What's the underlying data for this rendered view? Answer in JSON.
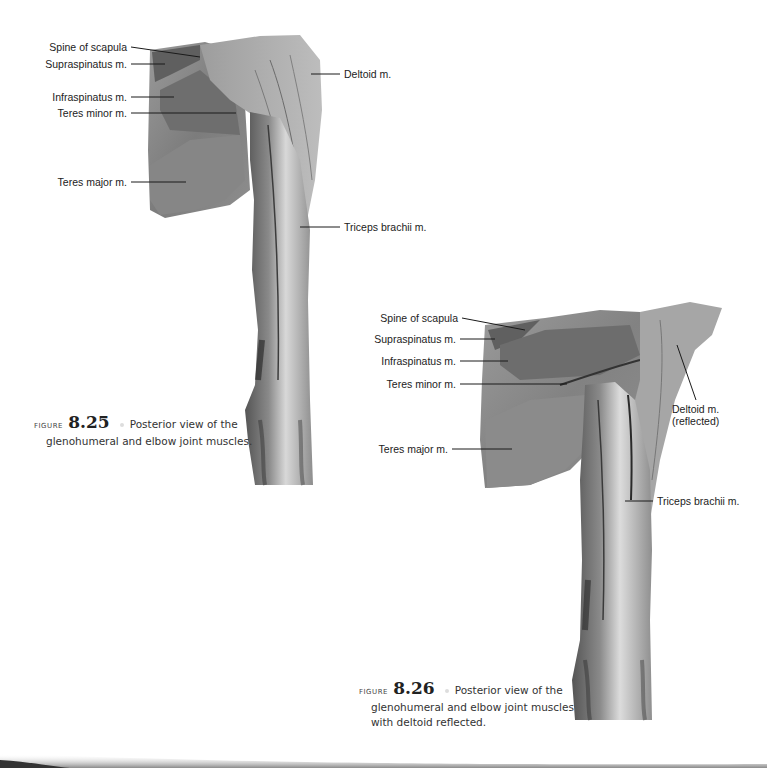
{
  "figures": [
    {
      "id": "8.25",
      "figure_word": "FIGURE",
      "number": "8.25",
      "caption_line1": "Posterior view of the",
      "caption_line2": "glenohumeral and elbow joint muscles.",
      "photo_description": "Cadaver dissection, posterior shoulder and arm",
      "labels": {
        "spine_of_scapula": "Spine of scapula",
        "supraspinatus": "Supraspinatus m.",
        "infraspinatus": "Infraspinatus m.",
        "teres_minor": "Teres minor m.",
        "teres_major": "Teres major m.",
        "deltoid": "Deltoid m.",
        "triceps": "Triceps brachii m."
      }
    },
    {
      "id": "8.26",
      "figure_word": "FIGURE",
      "number": "8.26",
      "caption_line1": "Posterior view of the",
      "caption_line2": "glenohumeral and elbow joint muscles",
      "caption_line3": "with deltoid reflected.",
      "photo_description": "Cadaver dissection, posterior shoulder with deltoid reflected",
      "labels": {
        "spine_of_scapula": "Spine of scapula",
        "supraspinatus": "Supraspinatus m.",
        "infraspinatus": "Infraspinatus m.",
        "teres_minor": "Teres minor m.",
        "teres_major": "Teres major m.",
        "deltoid_line1": "Deltoid m.",
        "deltoid_line2": "(reflected)",
        "triceps": "Triceps brachii m."
      }
    }
  ]
}
